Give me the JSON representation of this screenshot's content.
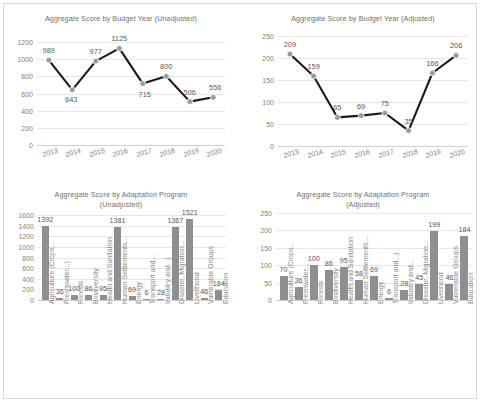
{
  "charts": {
    "budget_unadjusted": {
      "title": "Aggregate Score by Budget Year (Unadjusted)"
    },
    "budget_adjusted": {
      "title": "Aggregate Score by Budget Year (Adjusted)"
    },
    "program_unadjusted": {
      "title_line1": "Aggregate Score by Adaptation Program",
      "title_line2": "(Unadjusted)"
    },
    "program_adjusted": {
      "title_line1": "Aggregate Score by Adaptation Program",
      "title_line2": "(Adjusted)"
    }
  },
  "chart_data": [
    {
      "id": "budget_unadjusted",
      "type": "line",
      "title": "Aggregate Score by Budget Year (Unadjusted)",
      "xlabel": "",
      "ylabel": "",
      "categories": [
        "2013",
        "2014",
        "2015",
        "2016",
        "2017",
        "2018",
        "2019",
        "2020"
      ],
      "values": [
        989,
        643,
        977,
        1125,
        715,
        800,
        506,
        556
      ],
      "ylim": [
        0,
        1200
      ],
      "yticks": [
        0,
        200,
        400,
        600,
        800,
        1000,
        1200
      ],
      "grid": true,
      "legend": "none",
      "line_color": "#1a1a1a",
      "marker_color": "#9a9a9a",
      "data_labels": true
    },
    {
      "id": "budget_adjusted",
      "type": "line",
      "title": "Aggregate Score by Budget Year (Adjusted)",
      "xlabel": "",
      "ylabel": "",
      "categories": [
        "2013",
        "2014",
        "2015",
        "2016",
        "2017",
        "2018",
        "2019",
        "2020"
      ],
      "values": [
        209,
        159,
        65,
        69,
        75,
        35,
        166,
        206
      ],
      "ylim": [
        0,
        250
      ],
      "yticks": [
        0,
        50,
        100,
        150,
        200,
        250
      ],
      "grid": true,
      "legend": "none",
      "line_color": "#1a1a1a",
      "marker_color": "#9a9a9a",
      "data_labels": true
    },
    {
      "id": "program_unadjusted",
      "type": "bar",
      "title": "Aggregate Score by Adaptation Program (Unadjusted)",
      "xlabel": "",
      "ylabel": "",
      "categories": [
        "Agriculture (Crops...",
        "Freshwater...)",
        "Forests",
        "Biodiversity",
        "Health and Sanitation",
        "Human Settlements...",
        "Energy",
        "Transport and...",
        "Industry and...)",
        "Disaster, Migration...",
        "Livelihood",
        "Vulnerable Groups",
        "Education"
      ],
      "values": [
        1392,
        36,
        100,
        86,
        95,
        1381,
        69,
        6,
        28,
        1367,
        1521,
        46,
        184
      ],
      "ylim": [
        0,
        1600
      ],
      "yticks": [
        0,
        200,
        400,
        600,
        800,
        1000,
        1200,
        1400,
        1600
      ],
      "grid": true,
      "legend": "none",
      "bar_color": "#8f8f8f",
      "data_labels": true
    },
    {
      "id": "program_adjusted",
      "type": "bar",
      "title": "Aggregate Score by Adaptation Program (Adjusted)",
      "xlabel": "",
      "ylabel": "",
      "categories": [
        "Agriculture (Crops...",
        "Freshwater...",
        "Forests",
        "Biodiversity",
        "Health and Sanitation",
        "Human Settlements...",
        "Energy",
        "Transport and...)",
        "Industry and...",
        "Disaster, Migration...",
        "Livelihood",
        "Vulnerable Groups",
        "Education"
      ],
      "values": [
        70,
        36,
        100,
        86,
        95,
        58,
        69,
        6,
        28,
        45,
        199,
        46,
        184
      ],
      "ylim": [
        0,
        250
      ],
      "yticks": [
        0,
        50,
        100,
        150,
        200,
        250
      ],
      "grid": true,
      "legend": "none",
      "bar_color": "#8f8f8f",
      "data_labels": true
    }
  ]
}
